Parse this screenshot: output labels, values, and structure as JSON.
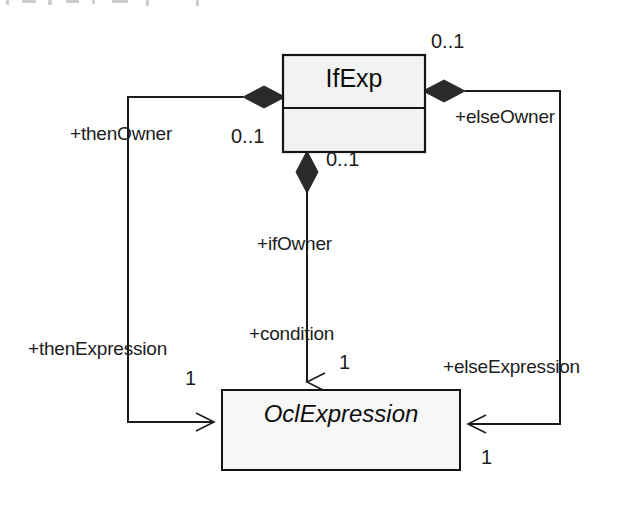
{
  "diagram": {
    "type": "uml-class-diagram",
    "background_color": "#ffffff",
    "line_color": "#1c1c1c",
    "classes": [
      {
        "id": "ifexp",
        "name": "IfExp",
        "abstract": false,
        "fill": "#f2f2f2",
        "compartments": [
          "name",
          "attributes"
        ]
      },
      {
        "id": "oclexpression",
        "name": "OclExpression",
        "abstract": true,
        "fill": "#f7f7f7",
        "compartments": [
          "name"
        ]
      }
    ],
    "associations": [
      {
        "id": "then",
        "owner_role": "+thenOwner",
        "owner_multiplicity": "0..1",
        "target_role": "+thenExpression",
        "target_multiplicity": "1",
        "aggregation": "composite",
        "side": "left"
      },
      {
        "id": "else",
        "owner_role": "+elseOwner",
        "owner_multiplicity": "0..1",
        "target_role": "+elseExpression",
        "target_multiplicity": "1",
        "aggregation": "composite",
        "side": "right"
      },
      {
        "id": "if",
        "owner_role": "+ifOwner",
        "owner_multiplicity": "0..1",
        "target_role": "+condition",
        "target_multiplicity": "1",
        "aggregation": "composite",
        "side": "bottom"
      }
    ]
  },
  "labels": {
    "then_owner": "+thenOwner",
    "then_owner_mult": "0..1",
    "then_expression": "+thenExpression",
    "then_expression_mult": "1",
    "else_owner": "+elseOwner",
    "else_owner_mult": "0..1",
    "else_expression": "+elseExpression",
    "else_expression_mult": "1",
    "if_owner": "+ifOwner",
    "if_owner_mult": "0..1",
    "condition": "+condition",
    "condition_mult": "1",
    "ifexp_name": "IfExp",
    "oclexpression_name": "OclExpression"
  }
}
